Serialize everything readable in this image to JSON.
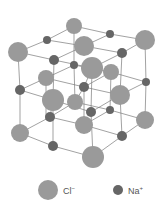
{
  "colors": {
    "cl": "#9a9a9a",
    "na": "#666666",
    "bond": "#7a7a7a"
  },
  "legend": {
    "cl": {
      "symbol": "Cl",
      "charge": "−"
    },
    "na": {
      "symbol": "Na",
      "charge": "+"
    }
  },
  "atoms": [
    {
      "type": "cl",
      "x": 74,
      "y": 26,
      "r": 8
    },
    {
      "type": "cl",
      "x": 145,
      "y": 40,
      "r": 10
    },
    {
      "type": "cl",
      "x": 18,
      "y": 52,
      "r": 10
    },
    {
      "type": "cl",
      "x": 84,
      "y": 46,
      "r": 10
    },
    {
      "type": "cl",
      "x": 92,
      "y": 68,
      "r": 11
    },
    {
      "type": "cl",
      "x": 111,
      "y": 72,
      "r": 8
    },
    {
      "type": "cl",
      "x": 46,
      "y": 78,
      "r": 8
    },
    {
      "type": "cl",
      "x": 120,
      "y": 95,
      "r": 10
    },
    {
      "type": "cl",
      "x": 53,
      "y": 100,
      "r": 11
    },
    {
      "type": "cl",
      "x": 75,
      "y": 102,
      "r": 8
    },
    {
      "type": "cl",
      "x": 145,
      "y": 120,
      "r": 9
    },
    {
      "type": "cl",
      "x": 84,
      "y": 125,
      "r": 9
    },
    {
      "type": "cl",
      "x": 20,
      "y": 133,
      "r": 9
    },
    {
      "type": "cl",
      "x": 93,
      "y": 157,
      "r": 11
    },
    {
      "type": "na",
      "x": 110,
      "y": 34,
      "r": 4
    },
    {
      "type": "na",
      "x": 47,
      "y": 40,
      "r": 4
    },
    {
      "type": "na",
      "x": 122,
      "y": 53,
      "r": 5
    },
    {
      "type": "na",
      "x": 54,
      "y": 60,
      "r": 5
    },
    {
      "type": "na",
      "x": 74,
      "y": 65,
      "r": 4
    },
    {
      "type": "na",
      "x": 84,
      "y": 87,
      "r": 5
    },
    {
      "type": "na",
      "x": 146,
      "y": 82,
      "r": 4
    },
    {
      "type": "na",
      "x": 20,
      "y": 90,
      "r": 5
    },
    {
      "type": "na",
      "x": 110,
      "y": 110,
      "r": 4
    },
    {
      "type": "na",
      "x": 91,
      "y": 112,
      "r": 5
    },
    {
      "type": "na",
      "x": 50,
      "y": 117,
      "r": 5
    },
    {
      "type": "na",
      "x": 122,
      "y": 136,
      "r": 5
    },
    {
      "type": "na",
      "x": 53,
      "y": 146,
      "r": 5
    }
  ],
  "bonds": [
    [
      74,
      26,
      110,
      34
    ],
    [
      110,
      34,
      145,
      40
    ],
    [
      18,
      52,
      47,
      40
    ],
    [
      47,
      40,
      74,
      26
    ],
    [
      18,
      52,
      54,
      60
    ],
    [
      54,
      60,
      92,
      68
    ],
    [
      92,
      68,
      122,
      53
    ],
    [
      122,
      53,
      145,
      40
    ],
    [
      84,
      46,
      122,
      53
    ],
    [
      47,
      40,
      84,
      46
    ],
    [
      84,
      46,
      110,
      34
    ],
    [
      54,
      60,
      84,
      46
    ],
    [
      74,
      65,
      111,
      72
    ],
    [
      46,
      78,
      74,
      65
    ],
    [
      74,
      65,
      74,
      26
    ],
    [
      18,
      52,
      20,
      90
    ],
    [
      20,
      90,
      20,
      133
    ],
    [
      145,
      40,
      146,
      82
    ],
    [
      146,
      82,
      145,
      120
    ],
    [
      54,
      60,
      53,
      100
    ],
    [
      53,
      100,
      53,
      146
    ],
    [
      92,
      68,
      91,
      112
    ],
    [
      91,
      112,
      93,
      157
    ],
    [
      122,
      53,
      120,
      95
    ],
    [
      120,
      95,
      122,
      136
    ],
    [
      20,
      90,
      53,
      100
    ],
    [
      53,
      100,
      91,
      112
    ],
    [
      91,
      112,
      120,
      95
    ],
    [
      120,
      95,
      146,
      82
    ],
    [
      20,
      90,
      46,
      78
    ],
    [
      46,
      78,
      84,
      87
    ],
    [
      84,
      87,
      120,
      95
    ],
    [
      84,
      87,
      111,
      72
    ],
    [
      111,
      72,
      146,
      82
    ],
    [
      20,
      133,
      53,
      146
    ],
    [
      53,
      146,
      93,
      157
    ],
    [
      93,
      157,
      122,
      136
    ],
    [
      122,
      136,
      145,
      120
    ],
    [
      20,
      133,
      50,
      117
    ],
    [
      50,
      117,
      84,
      125
    ],
    [
      84,
      125,
      122,
      136
    ],
    [
      84,
      125,
      110,
      110
    ],
    [
      110,
      110,
      145,
      120
    ],
    [
      53,
      100,
      50,
      117
    ],
    [
      46,
      78,
      46,
      120
    ],
    [
      75,
      102,
      110,
      110
    ],
    [
      50,
      117,
      75,
      102
    ],
    [
      75,
      102,
      84,
      87
    ],
    [
      84,
      87,
      84,
      125
    ],
    [
      111,
      72,
      110,
      110
    ],
    [
      74,
      65,
      75,
      102
    ],
    [
      92,
      68,
      84,
      87
    ]
  ]
}
